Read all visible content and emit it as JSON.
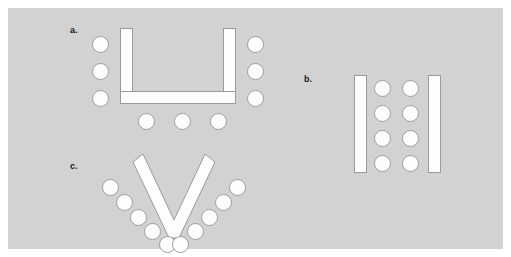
{
  "figure": {
    "background_color": "#ffffff",
    "panel_color": "#d2d2d2",
    "shape_fill": "#fdfdfd",
    "shape_stroke": "#9a9a9a",
    "chair_stroke": "#9d9d9d",
    "label_color": "#1a1a1a",
    "width": 511,
    "height": 257
  },
  "arrangements": [
    {
      "id": "a",
      "label": "a.",
      "name": "u-shape-table-arrangement",
      "table_style": "U-shape",
      "chair_count": 9,
      "chair_groups": [
        {
          "side": "left",
          "count": 3
        },
        {
          "side": "right",
          "count": 3
        },
        {
          "side": "bottom",
          "count": 3
        }
      ],
      "slabs": [
        {
          "name": "u-left-slab"
        },
        {
          "name": "u-right-slab"
        },
        {
          "name": "u-bottom-slab"
        }
      ]
    },
    {
      "id": "b",
      "label": "b.",
      "name": "parallel-rows-table-arrangement",
      "table_style": "Two parallel rectangles",
      "chair_count": 8,
      "chair_groups": [
        {
          "side": "inner-left-column",
          "count": 4
        },
        {
          "side": "inner-right-column",
          "count": 4
        }
      ],
      "slabs": [
        {
          "name": "b-left-slab"
        },
        {
          "name": "b-right-slab"
        }
      ]
    },
    {
      "id": "c",
      "label": "c.",
      "name": "v-shape-table-arrangement",
      "table_style": "V-shape (chevron)",
      "chair_count": 10,
      "chair_groups": [
        {
          "side": "left-arm",
          "count": 5
        },
        {
          "side": "right-arm",
          "count": 5
        }
      ],
      "slabs": [
        {
          "name": "v-left-arm-slab"
        },
        {
          "name": "v-right-arm-slab"
        }
      ]
    }
  ],
  "chairs": {
    "a_left": [
      {
        "x": 0,
        "y": 0
      },
      {
        "x": 0,
        "y": 27
      },
      {
        "x": 0,
        "y": 54
      }
    ],
    "a_right": [
      {
        "x": 0,
        "y": 0
      },
      {
        "x": 0,
        "y": 27
      },
      {
        "x": 0,
        "y": 54
      }
    ],
    "a_bottom": [
      {
        "x": 0,
        "y": 0
      },
      {
        "x": 36,
        "y": 0
      },
      {
        "x": 72,
        "y": 0
      }
    ],
    "b_col1": [
      {
        "x": 0,
        "y": 0
      },
      {
        "x": 0,
        "y": 25
      },
      {
        "x": 0,
        "y": 50
      },
      {
        "x": 0,
        "y": 75
      }
    ],
    "b_col2": [
      {
        "x": 0,
        "y": 0
      },
      {
        "x": 0,
        "y": 25
      },
      {
        "x": 0,
        "y": 50
      },
      {
        "x": 0,
        "y": 75
      }
    ],
    "c_left": [
      {
        "x": 0,
        "y": 0
      },
      {
        "x": 15,
        "y": 15
      },
      {
        "x": 30,
        "y": 30
      },
      {
        "x": 45,
        "y": 45
      },
      {
        "x": 60,
        "y": 60
      }
    ],
    "c_right": [
      {
        "x": 60,
        "y": 0
      },
      {
        "x": 45,
        "y": 15
      },
      {
        "x": 30,
        "y": 30
      },
      {
        "x": 15,
        "y": 45
      },
      {
        "x": 0,
        "y": 60
      }
    ]
  }
}
